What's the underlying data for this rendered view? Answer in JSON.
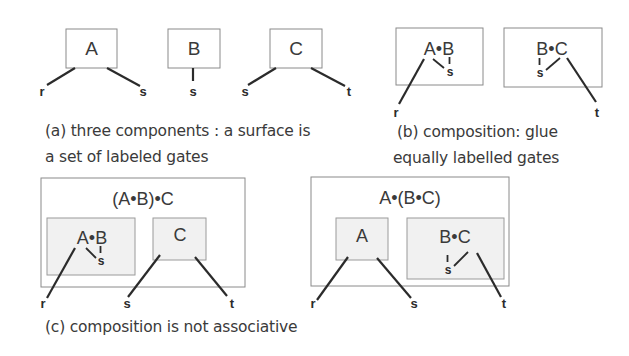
{
  "colors": {
    "line": "#2b2b2b",
    "box_border": "#8a8a8a",
    "inner_fill": "#f1f1f1",
    "text": "#3a3a3a"
  },
  "panel_a": {
    "components": [
      {
        "label": "A",
        "gates": [
          "r",
          "s"
        ]
      },
      {
        "label": "B",
        "gates": [
          "s"
        ]
      },
      {
        "label": "C",
        "gates": [
          "s",
          "t"
        ]
      }
    ],
    "caption_line1": "(a) three components : a surface is",
    "caption_line2": "a set of labeled gates"
  },
  "panel_b": {
    "compositions": [
      {
        "label": "A•B",
        "inner_gate": "s",
        "outer_gate": "r"
      },
      {
        "label": "B•C",
        "inner_gate": "s",
        "outer_gate": "t"
      }
    ],
    "caption_line1": "(b)  composition: glue",
    "caption_line2": "equally labelled gates"
  },
  "panel_c": {
    "left": {
      "outer_label": "(A•B)•C",
      "inner_left_label": "A•B",
      "inner_left_gate": "s",
      "inner_right_label": "C",
      "gates": [
        "r",
        "s",
        "t"
      ]
    },
    "right": {
      "outer_label": "A•(B•C)",
      "inner_left_label": "A",
      "inner_right_label": "B•C",
      "inner_right_gate": "s",
      "gates": [
        "r",
        "s",
        "t"
      ]
    },
    "caption": "(c)  composition is not associative"
  }
}
